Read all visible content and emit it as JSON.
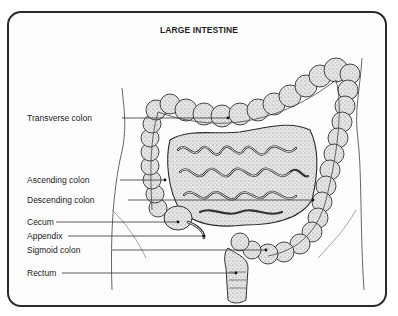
{
  "diagram": {
    "title": "LARGE INTESTINE",
    "labels": [
      {
        "id": "transverse-colon",
        "text": "Transverse colon",
        "y": 113
      },
      {
        "id": "ascending-colon",
        "text": "Ascending colon",
        "y": 175
      },
      {
        "id": "descending-colon",
        "text": "Descending colon",
        "y": 195
      },
      {
        "id": "cecum",
        "text": "Cecum",
        "y": 217
      },
      {
        "id": "appendix",
        "text": "Appendix",
        "y": 231
      },
      {
        "id": "sigmoid-colon",
        "text": "Sigmoid colon",
        "y": 245
      },
      {
        "id": "rectum",
        "text": "Rectum",
        "y": 268
      }
    ],
    "colors": {
      "frame": "#2a2a2a",
      "ink": "#222222",
      "shade": "#9a9a9a",
      "tissue": "#d9d9d9"
    }
  }
}
